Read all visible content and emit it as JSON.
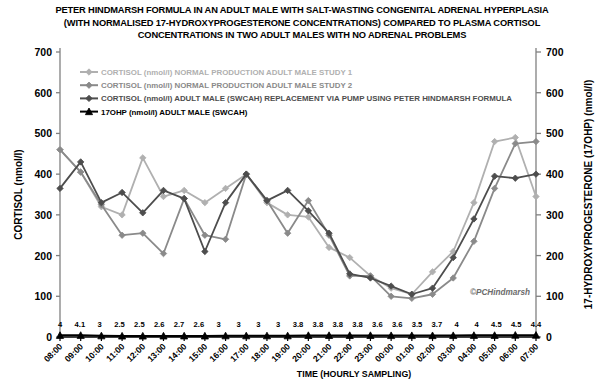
{
  "chart_data": {
    "type": "line",
    "title_lines": [
      "PETER HINDMARSH FORMULA IN AN ADULT MALE WITH SALT-WASTING CONGENITAL ADRENAL HYPERPLASIA",
      "(WITH NORMALISED 17-HYDROXYPROGESTERONE CONCENTRATIONS) COMPARED TO PLASMA CORTISOL",
      "CONCENTRATIONS IN TWO ADULT MALES WITH NO ADRENAL PROBLEMS"
    ],
    "xlabel": "TIME (HOURLY SAMPLING)",
    "ylabel": "CORTISOL (nmol/l)",
    "ylabel_right": "17-HYDROXYPROGESTERONE (17OHP) (nmol/l)",
    "ylim": [
      0,
      700
    ],
    "ylim_right": [
      0,
      700
    ],
    "yticks": [
      0,
      100,
      200,
      300,
      400,
      500,
      600,
      700
    ],
    "yticks_right": [
      0,
      100,
      200,
      300,
      400,
      500,
      600,
      700
    ],
    "grid": false,
    "legend_position": "top-left-inside",
    "watermark": "©PCHindmarsh",
    "categories": [
      "08:00",
      "09:00",
      "10:00",
      "11:00",
      "12:00",
      "13:00",
      "14:00",
      "15:00",
      "16:00",
      "17:00",
      "18:00",
      "19:00",
      "20:00",
      "21:00",
      "22:00",
      "23:00",
      "00:00",
      "01:00",
      "02:00",
      "03:00",
      "04:00",
      "05:00",
      "06:00",
      "07:00"
    ],
    "series": [
      {
        "name": "CORTISOL (nmol/l) NORMAL PRODUCTION ADULT MALE STUDY 1",
        "color": "#b0b0b0",
        "axis": "left",
        "marker": "diamond",
        "values": [
          460,
          405,
          320,
          300,
          440,
          345,
          360,
          330,
          365,
          400,
          330,
          300,
          295,
          220,
          195,
          150,
          120,
          105,
          160,
          210,
          330,
          480,
          490,
          345
        ]
      },
      {
        "name": "CORTISOL (nmol/l) NORMAL PRODUCTION ADULT MALE STUDY 2",
        "color": "#8a8a8a",
        "axis": "left",
        "marker": "diamond",
        "values": [
          460,
          405,
          325,
          250,
          255,
          205,
          340,
          250,
          240,
          400,
          335,
          255,
          335,
          250,
          150,
          150,
          100,
          95,
          105,
          145,
          235,
          365,
          475,
          480
        ]
      },
      {
        "name": "CORTISOL (nmol/l) ADULT MALE (SWCAH) REPLACEMENT VIA PUMP USING PETER HINDMARSH FORMULA",
        "color": "#4d4d4d",
        "axis": "left",
        "marker": "diamond",
        "values": [
          365,
          430,
          330,
          355,
          305,
          360,
          340,
          210,
          330,
          400,
          335,
          360,
          310,
          255,
          155,
          145,
          125,
          105,
          120,
          195,
          290,
          395,
          390,
          400
        ]
      },
      {
        "name": "17OHP (nmol/l) ADULT MALE (SWCAH)",
        "color": "#000000",
        "axis": "right",
        "marker": "triangle",
        "values": [
          4,
          4.1,
          3,
          2.5,
          2.5,
          2.6,
          2.7,
          2.6,
          3,
          3,
          3,
          3,
          3.8,
          3.8,
          3.8,
          3.8,
          3.6,
          3.6,
          3.5,
          3.7,
          4,
          4,
          4.5,
          4.5
        ],
        "point_labels": [
          "4",
          "4.1",
          "3",
          "2.5",
          "2.5",
          "2.6",
          "2.7",
          "2.6",
          "3",
          "3",
          "3",
          "3",
          "3.8",
          "3.8",
          "3.8",
          "3.8",
          "3.6",
          "3.6",
          "3.5",
          "3.7",
          "4",
          "4",
          "4.5",
          "4.5"
        ]
      }
    ],
    "point_label_row": [
      "4",
      "4.1",
      "3",
      "2.5",
      "2.5",
      "2.6",
      "2.7",
      "2.6",
      "3",
      "3",
      "3",
      "3",
      "3.8",
      "3.8",
      "3.8",
      "3.8",
      "3.6",
      "3.6",
      "3.5",
      "3.7",
      "4",
      "4",
      "4.5",
      "4.5",
      "4.4"
    ]
  }
}
